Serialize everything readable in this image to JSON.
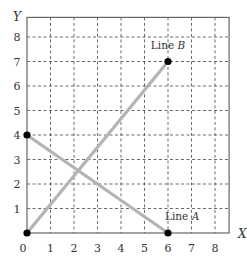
{
  "chart_data": {
    "type": "line",
    "title": "",
    "xlabel": "X",
    "ylabel": "Y",
    "xlim": [
      0,
      8.6
    ],
    "ylim": [
      0,
      8.8
    ],
    "xticks": [
      0,
      1,
      2,
      3,
      4,
      5,
      6,
      7,
      8
    ],
    "yticks": [
      1,
      2,
      3,
      4,
      5,
      6,
      7,
      8
    ],
    "grid": true,
    "grid_style": "dashed",
    "legend": "none (inline labels)",
    "series": [
      {
        "name": "Line A",
        "label": "Line A",
        "points": [
          {
            "x": 0,
            "y": 4
          },
          {
            "x": 6,
            "y": 0
          }
        ],
        "label_position": {
          "x": 6.6,
          "y": 0.55
        }
      },
      {
        "name": "Line B",
        "label": "Line B",
        "points": [
          {
            "x": 0,
            "y": 0
          },
          {
            "x": 6,
            "y": 7
          }
        ],
        "label_position": {
          "x": 6.0,
          "y": 7.5
        }
      }
    ],
    "colors": {
      "line": "#b4b4b4",
      "endpoint": "#000000",
      "grid": "#444444",
      "axis": "#555555"
    }
  },
  "labels": {
    "x_axis": "X",
    "y_axis": "Y",
    "line_a_prefix": "Line ",
    "line_a_letter": "A",
    "line_b_prefix": "Line ",
    "line_b_letter": "B",
    "x_ticks": [
      "0",
      "1",
      "2",
      "3",
      "4",
      "5",
      "6",
      "7",
      "8"
    ],
    "y_ticks": [
      "1",
      "2",
      "3",
      "4",
      "5",
      "6",
      "7",
      "8"
    ]
  }
}
